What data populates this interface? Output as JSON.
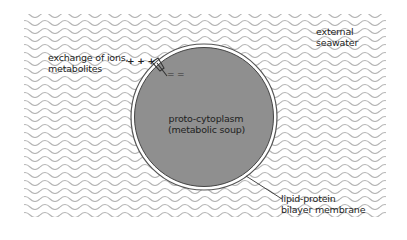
{
  "figure": {
    "type": "diagram",
    "colors": {
      "background": "#ffffff",
      "wave_line": "#b5b5b5",
      "cytoplasm_fill": "#8f8f8f",
      "membrane_outer": "#555555",
      "membrane_gap": "#ffffff",
      "text": "#222222"
    }
  },
  "labels": {
    "external": {
      "line1": "external",
      "line2": "seawater"
    },
    "exchange": {
      "line1": "exchange of ions,",
      "line2": "metabolites"
    },
    "cytoplasm": {
      "line1": "proto-cytoplasm",
      "line2": "(metabolic soup)"
    },
    "membrane": {
      "line1": "lipid-protein",
      "line2": "bilayer membrane"
    }
  },
  "channel": {
    "outside_charges": "+ + +",
    "inside_charges": "= ="
  }
}
